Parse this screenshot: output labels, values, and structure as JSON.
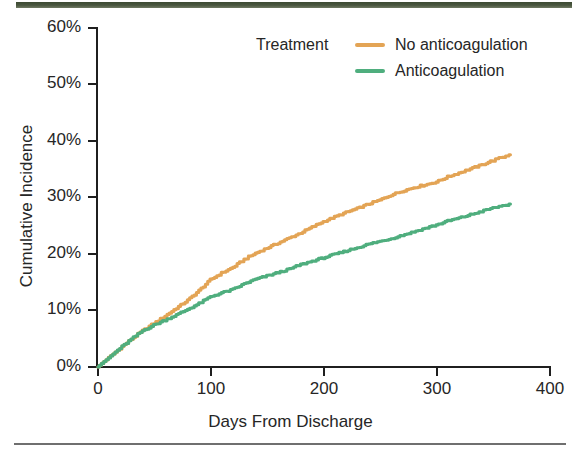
{
  "figure": {
    "background_color": "#ffffff",
    "scan_bar_top_color": "#44513a",
    "scan_bar_bottom_color": "#6f6f6f",
    "axis_color": "#1f1f1f"
  },
  "legend": {
    "title": "Treatment",
    "position": "top-center-right",
    "entries": [
      {
        "label": "No anticoagulation",
        "color": "#E3A455"
      },
      {
        "label": "Anticoagulation",
        "color": "#4FAE7E"
      }
    ]
  },
  "chart_data": {
    "type": "line",
    "title": "",
    "subtitle": "",
    "xlabel": "Days From Discharge",
    "ylabel": "Cumulative Incidence",
    "xlim": [
      0,
      400
    ],
    "ylim": [
      0,
      60
    ],
    "xticks": [
      0,
      100,
      200,
      300,
      400
    ],
    "xticklabels": [
      "0",
      "100",
      "200",
      "300",
      "400"
    ],
    "yticks": [
      0,
      10,
      20,
      30,
      40,
      50,
      60
    ],
    "yticklabels": [
      "0%",
      "10%",
      "20%",
      "30%",
      "40%",
      "50%",
      "60%"
    ],
    "grid": false,
    "legend_position": "upper center",
    "x": [
      0,
      10,
      20,
      30,
      40,
      50,
      60,
      70,
      80,
      90,
      100,
      110,
      120,
      130,
      140,
      150,
      160,
      170,
      180,
      190,
      200,
      210,
      220,
      230,
      240,
      250,
      260,
      270,
      280,
      290,
      300,
      310,
      320,
      330,
      340,
      350,
      365
    ],
    "series": [
      {
        "name": "No anticoagulation",
        "color": "#E3A455",
        "values": [
          0.0,
          1.6,
          3.3,
          4.9,
          6.4,
          7.7,
          9.0,
          10.4,
          11.8,
          13.5,
          15.4,
          16.6,
          17.6,
          19.0,
          20.1,
          21.0,
          21.9,
          22.8,
          23.7,
          24.7,
          25.7,
          26.5,
          27.3,
          28.0,
          28.8,
          29.5,
          30.4,
          31.1,
          31.7,
          32.2,
          32.7,
          33.6,
          34.3,
          35.0,
          35.7,
          36.5,
          37.5
        ]
      },
      {
        "name": "Anticoagulation",
        "color": "#4FAE7E",
        "values": [
          0.0,
          1.6,
          3.3,
          4.9,
          6.4,
          7.4,
          8.3,
          9.2,
          10.2,
          11.2,
          12.4,
          13.1,
          13.7,
          14.7,
          15.5,
          16.1,
          16.7,
          17.3,
          18.1,
          18.7,
          19.3,
          19.9,
          20.5,
          21.1,
          21.7,
          22.2,
          22.7,
          23.3,
          23.9,
          24.5,
          25.1,
          25.8,
          26.3,
          26.9,
          27.5,
          28.1,
          28.8
        ]
      }
    ]
  }
}
